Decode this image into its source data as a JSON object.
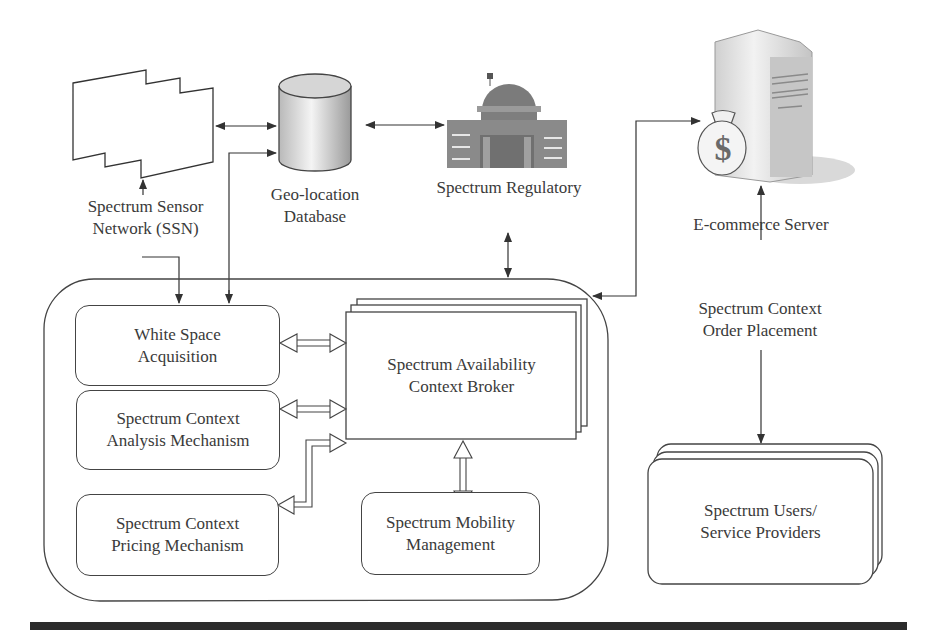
{
  "nodes": {
    "ssn": {
      "label_line1": "Spectrum Sensor",
      "label_line2": "Network (SSN)",
      "icon": "sensor-network-icon"
    },
    "geo_db": {
      "label_line1": "Geo-location",
      "label_line2": "Database",
      "icon": "database-cylinder-icon"
    },
    "regulatory": {
      "label": "Spectrum Regulatory",
      "icon": "government-building-icon"
    },
    "ecommerce": {
      "label": "E-commerce Server",
      "icon": "server-money-bag-icon",
      "money_symbol": "$"
    },
    "order_placement": {
      "label_line1": "Spectrum Context",
      "label_line2": "Order Placement"
    },
    "users": {
      "label_line1": "Spectrum Users/",
      "label_line2": "Service Providers"
    }
  },
  "broker_container": {
    "white_space": {
      "line1": "White Space",
      "line2": "Acquisition"
    },
    "analysis": {
      "line1": "Spectrum Context",
      "line2": "Analysis Mechanism"
    },
    "pricing": {
      "line1": "Spectrum Context",
      "line2": "Pricing Mechanism"
    },
    "broker": {
      "line1": "Spectrum Availability",
      "line2": "Context Broker"
    },
    "mobility": {
      "line1": "Spectrum Mobility",
      "line2": "Management"
    }
  },
  "colors": {
    "line": "#333333",
    "text": "#3a3a3a",
    "building": "#7a7a7a",
    "rule": "#2b2b2b"
  }
}
